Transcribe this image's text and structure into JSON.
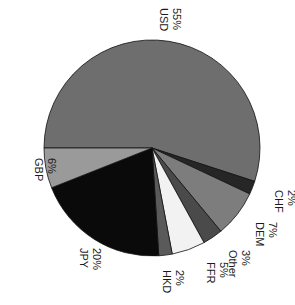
{
  "chart_data": {
    "type": "pie",
    "title": "",
    "orientation_note": "labels rotated 90 degrees clockwise",
    "categories": [
      "USD",
      "CHF",
      "DEM",
      "Other",
      "FFR",
      "HKD",
      "JPY",
      "GBP"
    ],
    "values": [
      55,
      2,
      7,
      3,
      5,
      2,
      20,
      6
    ],
    "unit": "%",
    "colors": [
      "#6e6e6e",
      "#262626",
      "#7d7d7d",
      "#4a4a4a",
      "#f2f2f2",
      "#5a5a5a",
      "#0a0a0a",
      "#9a9a9a"
    ],
    "labels": [
      {
        "name": "USD",
        "pct": "55%"
      },
      {
        "name": "CHF",
        "pct": "2%"
      },
      {
        "name": "DEM",
        "pct": "7%"
      },
      {
        "name": "Other",
        "pct": "3%"
      },
      {
        "name": "FFR",
        "pct": "5%"
      },
      {
        "name": "HKD",
        "pct": "2%"
      },
      {
        "name": "JPY",
        "pct": "20%"
      },
      {
        "name": "GBP",
        "pct": "6%"
      }
    ],
    "legend": "none (direct labels)"
  }
}
